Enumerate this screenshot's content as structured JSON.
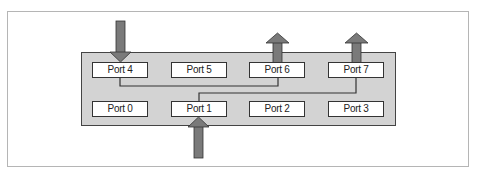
{
  "diagram": {
    "type": "switch-port-forwarding",
    "ports_top_row": [
      {
        "label": "Port 4",
        "x": 92,
        "y": 62
      },
      {
        "label": "Port 5",
        "x": 171,
        "y": 62
      },
      {
        "label": "Port 6",
        "x": 249,
        "y": 62
      },
      {
        "label": "Port 7",
        "x": 328,
        "y": 62
      }
    ],
    "ports_bottom_row": [
      {
        "label": "Port 0",
        "x": 92,
        "y": 101
      },
      {
        "label": "Port 1",
        "x": 171,
        "y": 101
      },
      {
        "label": "Port 2",
        "x": 249,
        "y": 101
      },
      {
        "label": "Port 3",
        "x": 328,
        "y": 101
      }
    ],
    "arrows": [
      {
        "port": "Port 4",
        "direction": "in"
      },
      {
        "port": "Port 1",
        "direction": "in"
      },
      {
        "port": "Port 6",
        "direction": "out"
      },
      {
        "port": "Port 7",
        "direction": "out"
      }
    ],
    "connections": [
      {
        "from": "Port 4",
        "to": "Port 6"
      },
      {
        "from": "Port 1",
        "to": "Port 7"
      }
    ],
    "colors": {
      "switch_fill": "#d3d3d3",
      "arrow_fill": "#7a7a7a",
      "line": "#333333"
    }
  }
}
